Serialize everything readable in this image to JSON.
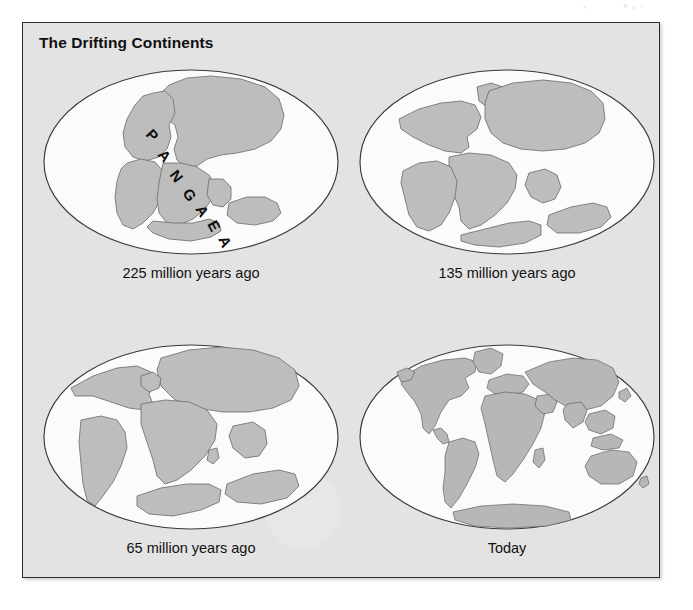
{
  "figure": {
    "title": "The Drifting Continents",
    "background_color": "#e3e3e3",
    "border_color": "#2a2a2a",
    "land_color": "#bdbdbd",
    "ocean_color": "#fbfbfb"
  },
  "pangaea_label": {
    "text": "PANGAEA",
    "letters": [
      "P",
      "A",
      "N",
      "G",
      "A",
      "E",
      "A"
    ]
  },
  "panels": [
    {
      "id": "panel-225",
      "caption": "225 million years ago",
      "age_million_years": 225,
      "supercontinent_label": "PANGAEA"
    },
    {
      "id": "panel-135",
      "caption": "135 million years ago",
      "age_million_years": 135,
      "supercontinent_label": ""
    },
    {
      "id": "panel-65",
      "caption": "65 million years ago",
      "age_million_years": 65,
      "supercontinent_label": ""
    },
    {
      "id": "panel-today",
      "caption": "Today",
      "age_million_years": 0,
      "supercontinent_label": ""
    }
  ]
}
